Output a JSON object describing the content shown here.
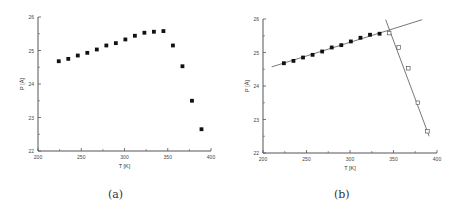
{
  "chart_data": [
    {
      "type": "scatter",
      "panel_label": "(a)",
      "xlabel": "T [K]",
      "ylabel": "P [Å]",
      "xlim": [
        200,
        400
      ],
      "ylim": [
        22,
        26
      ],
      "xticks": [
        "200",
        "250",
        "300",
        "350",
        "400"
      ],
      "yticks": [
        "22",
        "23",
        "24",
        "25",
        "26"
      ],
      "grid": false,
      "series": [
        {
          "name": "data",
          "marker": "filled-square",
          "x": [
            224,
            235,
            246,
            257,
            268,
            279,
            290,
            301,
            312,
            323,
            334,
            345,
            356,
            367,
            378,
            389
          ],
          "y": [
            24.68,
            24.75,
            24.85,
            24.93,
            25.03,
            25.15,
            25.22,
            25.33,
            25.44,
            25.53,
            25.56,
            25.58,
            25.15,
            24.53,
            23.5,
            22.65
          ]
        }
      ]
    },
    {
      "type": "scatter",
      "panel_label": "(b)",
      "xlabel": "T [K]",
      "ylabel": "P [Å]",
      "xlim": [
        200,
        400
      ],
      "ylim": [
        22,
        26
      ],
      "xticks": [
        "200",
        "250",
        "300",
        "350",
        "400"
      ],
      "yticks": [
        "22",
        "23",
        "24",
        "25",
        "26"
      ],
      "grid": false,
      "series": [
        {
          "name": "low-T phase",
          "marker": "filled-square",
          "x": [
            224,
            235,
            246,
            257,
            268,
            279,
            290,
            301,
            312,
            323,
            334
          ],
          "y": [
            24.68,
            24.75,
            24.85,
            24.93,
            25.03,
            25.15,
            25.22,
            25.33,
            25.44,
            25.53,
            25.56
          ]
        },
        {
          "name": "high-T phase",
          "marker": "open-square",
          "x": [
            345,
            356,
            367,
            378,
            389
          ],
          "y": [
            25.58,
            25.15,
            24.53,
            23.5,
            22.65
          ]
        }
      ],
      "fit_lines": [
        {
          "name": "linear fit low-T",
          "x": [
            210,
            383
          ],
          "y": [
            24.57,
            25.98
          ]
        },
        {
          "name": "linear fit high-T",
          "x": [
            341,
            391
          ],
          "y": [
            25.98,
            22.5
          ]
        }
      ]
    }
  ],
  "captions": {
    "a": "(a)",
    "b": "(b)"
  },
  "axis": {
    "xlabel": "T [K]",
    "ylabel": "P [Å]"
  }
}
